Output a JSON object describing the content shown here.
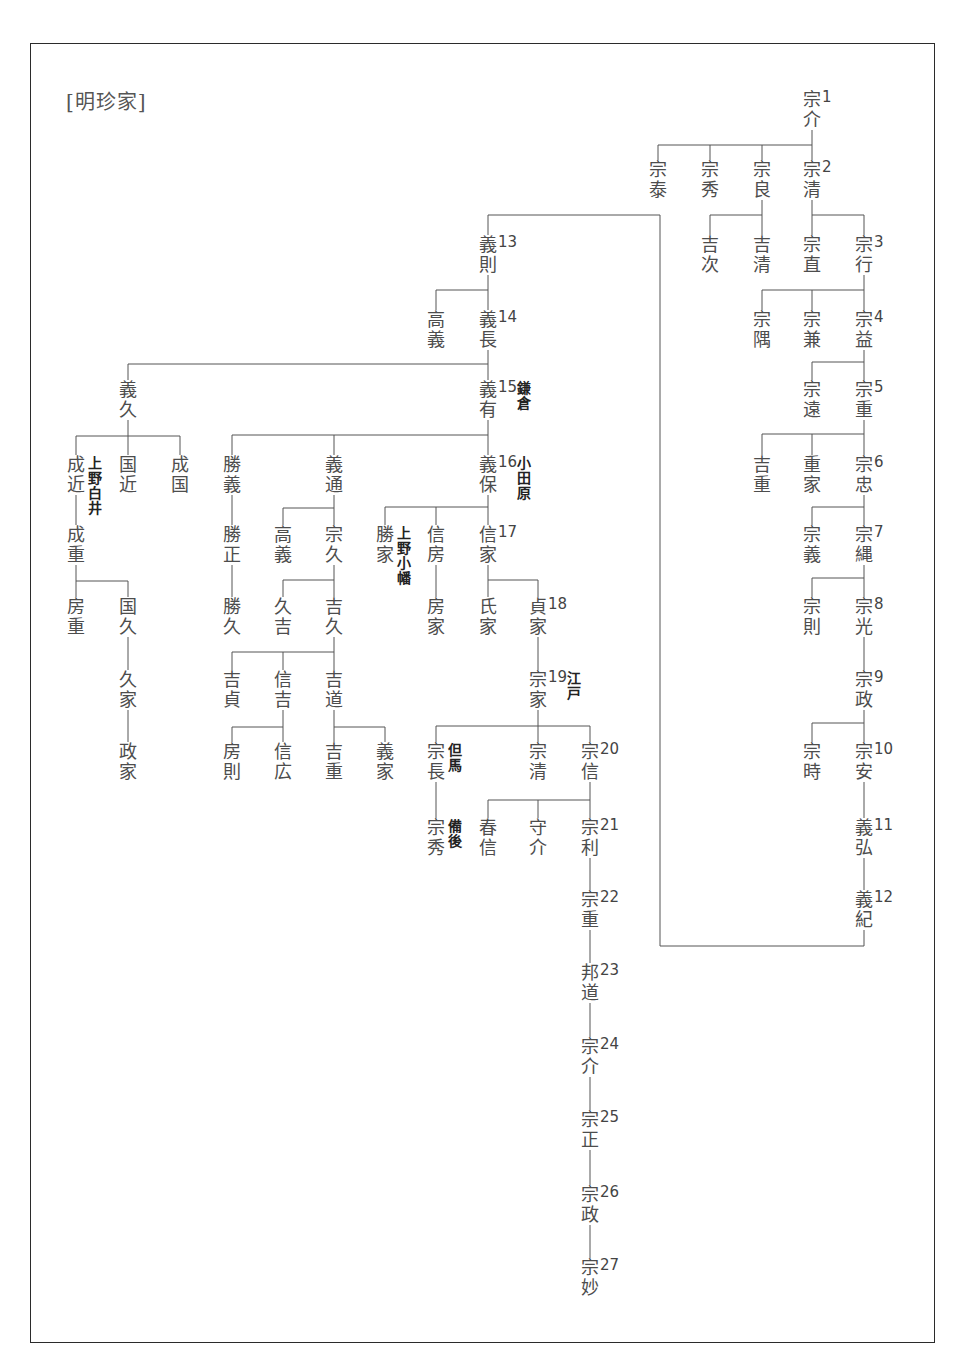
{
  "title": "[明珍家]",
  "footer_text": "",
  "line_color": "#555555",
  "nodes": [
    {
      "id": "n1",
      "name": "宗介",
      "gen": "1",
      "x": 812,
      "y": 90
    },
    {
      "id": "s_tai",
      "name": "宗泰",
      "x": 658,
      "y": 160
    },
    {
      "id": "s_hide",
      "name": "宗秀",
      "x": 710,
      "y": 160
    },
    {
      "id": "s_yoshi",
      "name": "宗良",
      "x": 762,
      "y": 160
    },
    {
      "id": "n2",
      "name": "宗清",
      "gen": "2",
      "x": 812,
      "y": 160
    },
    {
      "id": "kichiji",
      "name": "吉次",
      "x": 710,
      "y": 235
    },
    {
      "id": "kiyo",
      "name": "吉清",
      "x": 762,
      "y": 235
    },
    {
      "id": "s_nao",
      "name": "宗直",
      "x": 812,
      "y": 235
    },
    {
      "id": "n3",
      "name": "宗行",
      "gen": "3",
      "x": 864,
      "y": 235
    },
    {
      "id": "s_gu",
      "name": "宗隅",
      "x": 762,
      "y": 310
    },
    {
      "id": "s_ken",
      "name": "宗兼",
      "x": 812,
      "y": 310
    },
    {
      "id": "n4",
      "name": "宗益",
      "gen": "4",
      "x": 864,
      "y": 310
    },
    {
      "id": "s_to",
      "name": "宗遠",
      "x": 812,
      "y": 380
    },
    {
      "id": "n5",
      "name": "宗重",
      "gen": "5",
      "x": 864,
      "y": 380
    },
    {
      "id": "kichiju",
      "name": "吉重",
      "x": 762,
      "y": 455
    },
    {
      "id": "shigeie",
      "name": "重家",
      "x": 812,
      "y": 455
    },
    {
      "id": "n6",
      "name": "宗忠",
      "gen": "6",
      "x": 864,
      "y": 455
    },
    {
      "id": "s_gi",
      "name": "宗義",
      "x": 812,
      "y": 525
    },
    {
      "id": "n7",
      "name": "宗縄",
      "gen": "7",
      "x": 864,
      "y": 525
    },
    {
      "id": "s_nori",
      "name": "宗則",
      "x": 812,
      "y": 597
    },
    {
      "id": "n8",
      "name": "宗光",
      "gen": "8",
      "x": 864,
      "y": 597
    },
    {
      "id": "n9",
      "name": "宗政",
      "gen": "9",
      "x": 864,
      "y": 670
    },
    {
      "id": "s_toki",
      "name": "宗時",
      "x": 812,
      "y": 742
    },
    {
      "id": "n10",
      "name": "宗安",
      "gen": "10",
      "x": 864,
      "y": 742
    },
    {
      "id": "n11",
      "name": "義弘",
      "gen": "11",
      "x": 864,
      "y": 818
    },
    {
      "id": "n12",
      "name": "義紀",
      "gen": "12",
      "x": 864,
      "y": 890
    },
    {
      "id": "n13",
      "name": "義則",
      "gen": "13",
      "x": 488,
      "y": 235
    },
    {
      "id": "takayoshi1",
      "name": "高義",
      "x": 436,
      "y": 310
    },
    {
      "id": "n14",
      "name": "義長",
      "gen": "14",
      "x": 488,
      "y": 310
    },
    {
      "id": "yoshihisa",
      "name": "義久",
      "x": 128,
      "y": 380
    },
    {
      "id": "n15",
      "name": "義有",
      "gen": "15",
      "note": "鎌倉",
      "x": 488,
      "y": 380
    },
    {
      "id": "narichika",
      "name": "成近",
      "note": "上野白井",
      "x": 76,
      "y": 455
    },
    {
      "id": "kunichika",
      "name": "国近",
      "x": 128,
      "y": 455
    },
    {
      "id": "narikuni",
      "name": "成国",
      "x": 180,
      "y": 455
    },
    {
      "id": "katsuyoshi",
      "name": "勝義",
      "x": 232,
      "y": 455
    },
    {
      "id": "yoshimichi",
      "name": "義通",
      "x": 334,
      "y": 455
    },
    {
      "id": "n16",
      "name": "義保",
      "gen": "16",
      "note": "小田原",
      "x": 488,
      "y": 455
    },
    {
      "id": "narishige",
      "name": "成重",
      "x": 76,
      "y": 525
    },
    {
      "id": "katsumasa",
      "name": "勝正",
      "x": 232,
      "y": 525
    },
    {
      "id": "takayoshi2",
      "name": "高義",
      "x": 283,
      "y": 525
    },
    {
      "id": "munehisa",
      "name": "宗久",
      "x": 334,
      "y": 525
    },
    {
      "id": "katsuie",
      "name": "勝家",
      "note": "上野小幡",
      "x": 385,
      "y": 525
    },
    {
      "id": "nobufusa",
      "name": "信房",
      "x": 436,
      "y": 525
    },
    {
      "id": "n17",
      "name": "信家",
      "gen": "17",
      "x": 488,
      "y": 525
    },
    {
      "id": "fusashige",
      "name": "房重",
      "x": 76,
      "y": 597
    },
    {
      "id": "kunihisa",
      "name": "国久",
      "x": 128,
      "y": 597
    },
    {
      "id": "katsuhisa",
      "name": "勝久",
      "x": 232,
      "y": 597
    },
    {
      "id": "hisayoshi",
      "name": "久吉",
      "x": 283,
      "y": 597
    },
    {
      "id": "yoshihisa2",
      "name": "吉久",
      "x": 334,
      "y": 597
    },
    {
      "id": "fusaie",
      "name": "房家",
      "x": 436,
      "y": 597
    },
    {
      "id": "ujiie",
      "name": "氏家",
      "x": 488,
      "y": 597
    },
    {
      "id": "n18",
      "name": "貞家",
      "gen": "18",
      "x": 538,
      "y": 597
    },
    {
      "id": "hisaie",
      "name": "久家",
      "x": 128,
      "y": 670
    },
    {
      "id": "n19",
      "name": "宗家",
      "gen": "19",
      "note": "江戸",
      "x": 538,
      "y": 670
    },
    {
      "id": "yoshisada",
      "name": "吉貞",
      "x": 232,
      "y": 670
    },
    {
      "id": "nobuyoshi",
      "name": "信吉",
      "x": 283,
      "y": 670
    },
    {
      "id": "yoshimichi2",
      "name": "吉道",
      "x": 334,
      "y": 670
    },
    {
      "id": "masaie",
      "name": "政家",
      "x": 128,
      "y": 742
    },
    {
      "id": "fusanori",
      "name": "房則",
      "x": 232,
      "y": 742
    },
    {
      "id": "nobuhiro",
      "name": "信広",
      "x": 283,
      "y": 742
    },
    {
      "id": "yoshishige",
      "name": "吉重",
      "x": 334,
      "y": 742
    },
    {
      "id": "yoshiie",
      "name": "義家",
      "x": 385,
      "y": 742
    },
    {
      "id": "munenaga",
      "name": "宗長",
      "note": "但馬",
      "x": 436,
      "y": 742
    },
    {
      "id": "munekiyo",
      "name": "宗清",
      "x": 538,
      "y": 742
    },
    {
      "id": "n20",
      "name": "宗信",
      "gen": "20",
      "x": 590,
      "y": 742
    },
    {
      "id": "munehide",
      "name": "宗秀",
      "note": "備後",
      "x": 436,
      "y": 818
    },
    {
      "id": "harunobu",
      "name": "春信",
      "x": 488,
      "y": 818
    },
    {
      "id": "morisuke",
      "name": "守介",
      "x": 538,
      "y": 818
    },
    {
      "id": "n21",
      "name": "宗利",
      "gen": "21",
      "x": 590,
      "y": 818
    },
    {
      "id": "n22",
      "name": "宗重",
      "gen": "22",
      "x": 590,
      "y": 890
    },
    {
      "id": "n23",
      "name": "邦道",
      "gen": "23",
      "x": 590,
      "y": 963
    },
    {
      "id": "n24",
      "name": "宗介",
      "gen": "24",
      "x": 590,
      "y": 1037
    },
    {
      "id": "n25",
      "name": "宗正",
      "gen": "25",
      "x": 590,
      "y": 1110
    },
    {
      "id": "n26",
      "name": "宗政",
      "gen": "26",
      "x": 590,
      "y": 1185
    },
    {
      "id": "n27",
      "name": "宗妙",
      "gen": "27",
      "x": 590,
      "y": 1258
    }
  ]
}
